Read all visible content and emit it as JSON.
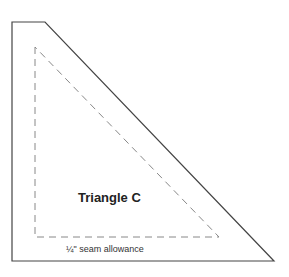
{
  "diagram": {
    "title": "Triangle C",
    "seam_label": "¼\" seam allowance",
    "colors": {
      "outline": "#444444",
      "seam_line": "#888888"
    }
  }
}
